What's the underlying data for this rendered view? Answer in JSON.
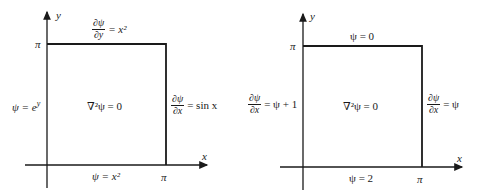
{
  "diagrams": [
    {
      "axis_x_label": "x",
      "axis_y_label": "y",
      "pi_y": "π",
      "pi_x": "π",
      "top_bc": {
        "num": "∂ψ",
        "den": "∂y",
        "rhs": "= x²"
      },
      "left_bc": "ψ = e^y",
      "left_bc_base": "ψ = e",
      "left_bc_exp": "y",
      "right_bc": {
        "num": "∂ψ",
        "den": "∂x",
        "rhs": "= sin x"
      },
      "bottom_bc": "ψ = x²",
      "equation": "∇²ψ = 0"
    },
    {
      "axis_x_label": "x",
      "axis_y_label": "y",
      "pi_y": "π",
      "pi_x": "π",
      "top_bc": "ψ = 0",
      "left_bc": {
        "num": "∂ψ",
        "den": "∂x",
        "rhs": "= ψ + 1"
      },
      "right_bc": {
        "num": "∂ψ",
        "den": "∂x",
        "rhs": "= ψ"
      },
      "bottom_bc": "ψ = 2",
      "equation": "∇²ψ = 0"
    }
  ],
  "colors": {
    "line": "#1a1a1a",
    "background": "#ffffff"
  }
}
